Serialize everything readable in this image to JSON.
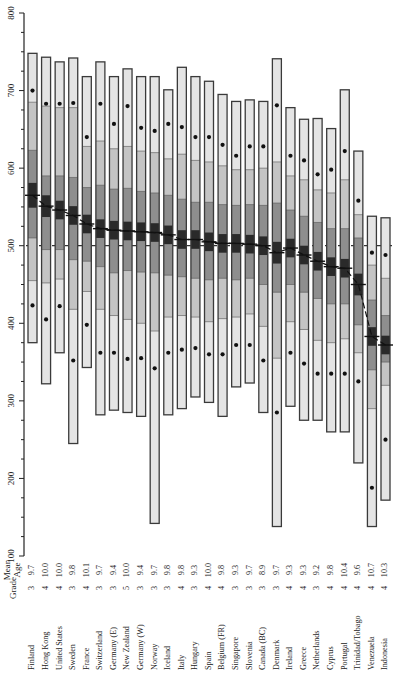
{
  "chart_data": {
    "type": "box-percentile",
    "title": "",
    "ylabel": "",
    "xlabel": "",
    "ylim": [
      100,
      800
    ],
    "yticks": [
      100,
      200,
      300,
      400,
      500,
      600,
      700,
      800
    ],
    "y_minor_step": 25,
    "reference_line": 500,
    "column_headers": {
      "grade": "Grade",
      "mean_age_line1": "Mean",
      "mean_age_line2": "Age"
    },
    "legend": "Percentiles: 1st, 5th (dot), 10th, 25th, mean ± CI (dark band), 75th, 90th, 95th (dot), 99th",
    "countries": [
      {
        "name": "Finland",
        "grade": "3",
        "age": "9.7",
        "p1": 375,
        "p5": 423,
        "p10": 455,
        "p25": 510,
        "mean": 565,
        "ci": 16,
        "p75": 623,
        "p90": 685,
        "p95": 700,
        "p99": 748
      },
      {
        "name": "Hong Kong",
        "grade": "4",
        "age": "10.0",
        "p1": 322,
        "p5": 405,
        "p10": 452,
        "p25": 495,
        "mean": 551,
        "ci": 14,
        "p75": 590,
        "p90": 680,
        "p95": 683,
        "p99": 743
      },
      {
        "name": "United States",
        "grade": "4",
        "age": "10.0",
        "p1": 362,
        "p5": 422,
        "p10": 457,
        "p25": 495,
        "mean": 546,
        "ci": 12,
        "p75": 590,
        "p90": 678,
        "p95": 683,
        "p99": 737
      },
      {
        "name": "Sweden",
        "grade": "3",
        "age": "9.8",
        "p1": 245,
        "p5": 352,
        "p10": 418,
        "p25": 482,
        "mean": 539,
        "ci": 12,
        "p75": 588,
        "p90": 678,
        "p95": 684,
        "p99": 742
      },
      {
        "name": "France",
        "grade": "4",
        "age": "10.1",
        "p1": 343,
        "p5": 398,
        "p10": 441,
        "p25": 480,
        "mean": 528,
        "ci": 12,
        "p75": 575,
        "p90": 628,
        "p95": 640,
        "p99": 718
      },
      {
        "name": "Switzerland",
        "grade": "3",
        "age": "9.7",
        "p1": 282,
        "p5": 362,
        "p10": 418,
        "p25": 473,
        "mean": 522,
        "ci": 12,
        "p75": 578,
        "p90": 635,
        "p95": 683,
        "p99": 737
      },
      {
        "name": "Germany (E)",
        "grade": "3",
        "age": "9.4",
        "p1": 288,
        "p5": 362,
        "p10": 410,
        "p25": 465,
        "mean": 520,
        "ci": 12,
        "p75": 573,
        "p90": 625,
        "p95": 657,
        "p99": 718
      },
      {
        "name": "New Zealand",
        "grade": "5",
        "age": "10.0",
        "p1": 285,
        "p5": 354,
        "p10": 405,
        "p25": 468,
        "mean": 519,
        "ci": 12,
        "p75": 574,
        "p90": 628,
        "p95": 680,
        "p99": 728
      },
      {
        "name": "Germany (W)",
        "grade": "3",
        "age": "9.4",
        "p1": 280,
        "p5": 355,
        "p10": 400,
        "p25": 466,
        "mean": 518,
        "ci": 12,
        "p75": 570,
        "p90": 622,
        "p95": 652,
        "p99": 718
      },
      {
        "name": "Norway",
        "grade": "3",
        "age": "9.7",
        "p1": 142,
        "p5": 342,
        "p10": 390,
        "p25": 465,
        "mean": 517,
        "ci": 12,
        "p75": 568,
        "p90": 620,
        "p95": 648,
        "p99": 718
      },
      {
        "name": "Iceland",
        "grade": "3",
        "age": "9.8",
        "p1": 282,
        "p5": 362,
        "p10": 408,
        "p25": 462,
        "mean": 514,
        "ci": 12,
        "p75": 565,
        "p90": 612,
        "p95": 657,
        "p99": 701
      },
      {
        "name": "Italy",
        "grade": "4",
        "age": "9.8",
        "p1": 290,
        "p5": 366,
        "p10": 410,
        "p25": 460,
        "mean": 508,
        "ci": 12,
        "p75": 560,
        "p90": 618,
        "p95": 653,
        "p99": 730
      },
      {
        "name": "Hungary",
        "grade": "3",
        "age": "9.3",
        "p1": 305,
        "p5": 368,
        "p10": 408,
        "p25": 458,
        "mean": 508,
        "ci": 12,
        "p75": 556,
        "p90": 610,
        "p95": 640,
        "p99": 718
      },
      {
        "name": "Spain",
        "grade": "4",
        "age": "10.0",
        "p1": 298,
        "p5": 360,
        "p10": 402,
        "p25": 456,
        "mean": 505,
        "ci": 12,
        "p75": 556,
        "p90": 608,
        "p95": 640,
        "p99": 712
      },
      {
        "name": "Belgium (FR)",
        "grade": "4",
        "age": "9.8",
        "p1": 280,
        "p5": 360,
        "p10": 406,
        "p25": 458,
        "mean": 503,
        "ci": 12,
        "p75": 553,
        "p90": 603,
        "p95": 630,
        "p99": 695
      },
      {
        "name": "Singapore",
        "grade": "3",
        "age": "9.3",
        "p1": 318,
        "p5": 372,
        "p10": 408,
        "p25": 456,
        "mean": 503,
        "ci": 12,
        "p75": 552,
        "p90": 598,
        "p95": 616,
        "p99": 686
      },
      {
        "name": "Slovenia",
        "grade": "3",
        "age": "9.7",
        "p1": 323,
        "p5": 372,
        "p10": 412,
        "p25": 458,
        "mean": 502,
        "ci": 12,
        "p75": 553,
        "p90": 598,
        "p95": 628,
        "p99": 688
      },
      {
        "name": "Canada (BC)",
        "grade": "3",
        "age": "8.9",
        "p1": 285,
        "p5": 352,
        "p10": 396,
        "p25": 450,
        "mean": 500,
        "ci": 12,
        "p75": 552,
        "p90": 600,
        "p95": 628,
        "p99": 686
      },
      {
        "name": "Denmark",
        "grade": "3",
        "age": "9.7",
        "p1": 138,
        "p5": 285,
        "p10": 355,
        "p25": 440,
        "mean": 491,
        "ci": 14,
        "p75": 555,
        "p90": 608,
        "p95": 681,
        "p99": 741
      },
      {
        "name": "Ireland",
        "grade": "4",
        "age": "9.3",
        "p1": 293,
        "p5": 362,
        "p10": 402,
        "p25": 450,
        "mean": 497,
        "ci": 12,
        "p75": 546,
        "p90": 590,
        "p95": 616,
        "p99": 678
      },
      {
        "name": "Greece",
        "grade": "4",
        "age": "9.3",
        "p1": 275,
        "p5": 348,
        "p10": 392,
        "p25": 440,
        "mean": 488,
        "ci": 12,
        "p75": 538,
        "p90": 585,
        "p95": 610,
        "p99": 663
      },
      {
        "name": "Netherlands",
        "grade": "3",
        "age": "9.2",
        "p1": 275,
        "p5": 335,
        "p10": 378,
        "p25": 432,
        "mean": 480,
        "ci": 12,
        "p75": 530,
        "p90": 572,
        "p95": 592,
        "p99": 664
      },
      {
        "name": "Cyprus",
        "grade": "4",
        "age": "9.8",
        "p1": 260,
        "p5": 335,
        "p10": 375,
        "p25": 425,
        "mean": 473,
        "ci": 12,
        "p75": 522,
        "p90": 568,
        "p95": 598,
        "p99": 651
      },
      {
        "name": "Portugal",
        "grade": "4",
        "age": "10.4",
        "p1": 260,
        "p5": 335,
        "p10": 380,
        "p25": 425,
        "mean": 471,
        "ci": 12,
        "p75": 522,
        "p90": 585,
        "p95": 622,
        "p99": 701
      },
      {
        "name": "Trinidad/Tobago",
        "grade": "4",
        "age": "9.6",
        "p1": 220,
        "p5": 325,
        "p10": 362,
        "p25": 398,
        "mean": 450,
        "ci": 14,
        "p75": 510,
        "p90": 540,
        "p95": 558,
        "p99": 622
      },
      {
        "name": "Venezuela",
        "grade": "4",
        "age": "10.7",
        "p1": 138,
        "p5": 188,
        "p10": 290,
        "p25": 340,
        "mean": 383,
        "ci": 12,
        "p75": 430,
        "p90": 475,
        "p95": 491,
        "p99": 538
      },
      {
        "name": "Indonesia",
        "grade": "4",
        "age": "10.3",
        "p1": 172,
        "p5": 250,
        "p10": 320,
        "p25": 350,
        "mean": 372,
        "ci": 12,
        "p75": 410,
        "p90": 458,
        "p95": 488,
        "p99": 536
      }
    ]
  },
  "colors": {
    "band_outer": "#e4e4e4",
    "band_10_25": "#c4c4c4",
    "band_25_75": "#8e8e8e",
    "band_ci": "#2a2a2a",
    "outline": "#3a3a3a",
    "dot": "#111111",
    "axis": "#222222"
  }
}
